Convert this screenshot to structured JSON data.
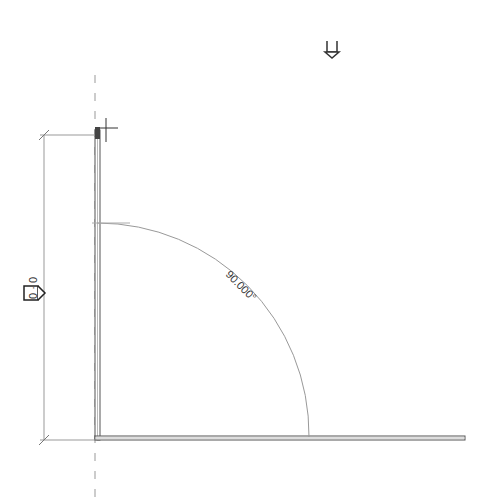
{
  "canvas": {
    "background": "#ffffff"
  },
  "drawing": {
    "angle_dimension": "90.000°",
    "length_dimension": "0 · 0",
    "colors": {
      "wall": "#555555",
      "dim_line": "#888888",
      "ref_plane": "#999999"
    }
  },
  "icons": [
    "view-tag-icon",
    "dimension-lock-icon",
    "move-crosshair-icon"
  ]
}
